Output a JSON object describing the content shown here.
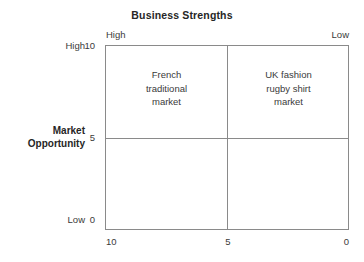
{
  "chart_data": {
    "type": "table",
    "title": "Business Strengths",
    "xlabel": "Business Strengths",
    "ylabel": "Market Opportunity",
    "x_axis": {
      "title": "Business Strengths",
      "scale_low_end_label": "Low",
      "scale_high_end_label": "High",
      "tick_labels": [
        "10",
        "5",
        "0"
      ],
      "tick_values": [
        10,
        5,
        0
      ],
      "direction": "descending-left-to-right",
      "xlim": [
        10,
        0
      ]
    },
    "y_axis": {
      "title": "Market Opportunity",
      "scale_low_end_label": "Low",
      "scale_high_end_label": "High",
      "tick_labels": [
        "10",
        "5",
        "0"
      ],
      "tick_values": [
        10,
        5,
        0
      ],
      "direction": "descending-top-to-bottom",
      "ylim": [
        0,
        10
      ]
    },
    "grid": true,
    "legend": "none",
    "quadrants": [
      {
        "id": "top-left",
        "label": "French\ntraditional\nmarket",
        "x_range": [
          10,
          5
        ],
        "y_range": [
          5,
          10
        ],
        "market_opportunity": "High",
        "business_strengths": "High"
      },
      {
        "id": "top-right",
        "label": "UK fashion\nrugby shirt\nmarket",
        "x_range": [
          5,
          0
        ],
        "y_range": [
          5,
          10
        ],
        "market_opportunity": "High",
        "business_strengths": "Low"
      },
      {
        "id": "bottom-left",
        "label": "",
        "x_range": [
          10,
          5
        ],
        "y_range": [
          0,
          5
        ],
        "market_opportunity": "Low",
        "business_strengths": "High"
      },
      {
        "id": "bottom-right",
        "label": "",
        "x_range": [
          5,
          0
        ],
        "y_range": [
          0,
          5
        ],
        "market_opportunity": "Low",
        "business_strengths": "Low"
      }
    ],
    "colors": {
      "background": "#ffffff",
      "line": "#8a8a8a",
      "text": "#3a3a3a",
      "heading": "#262626"
    }
  },
  "header": {
    "title": "Business Strengths"
  },
  "x_axis": {
    "high_label": "High",
    "low_label": "Low",
    "tick_10": "10",
    "tick_5": "5",
    "tick_0": "0"
  },
  "y_axis": {
    "title": "Market\nOpportunity",
    "high_label": "High",
    "low_label": "Low",
    "tick_10": "10",
    "tick_5": "5",
    "tick_0": "0"
  },
  "quadrants": {
    "top_left": "French\ntraditional\nmarket",
    "top_right": "UK fashion\nrugby shirt\nmarket",
    "bottom_left": "",
    "bottom_right": ""
  }
}
